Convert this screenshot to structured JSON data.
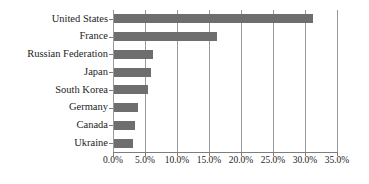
{
  "chart_data": {
    "type": "bar",
    "orientation": "horizontal",
    "title": "",
    "xlabel": "",
    "ylabel": "",
    "categories": [
      "United States",
      "France",
      "Russian Federation",
      "Japan",
      "South Korea",
      "Germany",
      "Canada",
      "Ukraine"
    ],
    "values": [
      31.2,
      16.3,
      6.3,
      6.0,
      5.5,
      3.9,
      3.4,
      3.1
    ],
    "value_suffix": "%",
    "xlim": [
      0,
      35
    ],
    "xticks": [
      0,
      5,
      10,
      15,
      20,
      25,
      30,
      35
    ],
    "xtick_labels": [
      "0.0%",
      "5.0%",
      "10.0%",
      "15.0%",
      "20.0%",
      "25.0%",
      "30.0%",
      "35.0%"
    ],
    "grid": "vertical",
    "legend": "none",
    "bar_color": "#6e6e6e",
    "axis_color": "#9a9a9a",
    "text_color": "#1d1d1d"
  }
}
